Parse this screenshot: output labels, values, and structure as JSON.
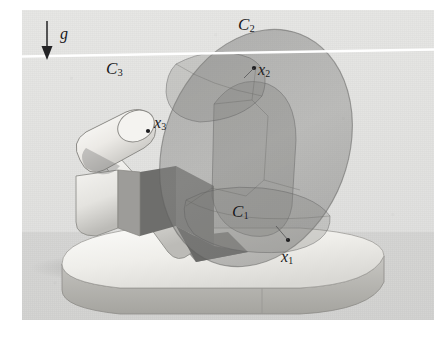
{
  "figure": {
    "kind": "technical-illustration",
    "background_color": "#e4e4e2",
    "plate_margin_color": "#ffffff"
  },
  "gravity": {
    "symbol": "g",
    "direction": "down",
    "arrow_color": "#232325"
  },
  "horizon_line": {
    "color": "#ffffff",
    "description": "white horizontal reference line spanning the plate"
  },
  "bounding_volumes": [
    {
      "id": "C1",
      "base": "C",
      "sub": "1",
      "label_x": 232,
      "label_y": 203,
      "fill": "#9a9a99"
    },
    {
      "id": "C2",
      "base": "C",
      "sub": "2",
      "label_x": 238,
      "label_y": 16,
      "fill": "#9a9a99"
    },
    {
      "id": "C3",
      "base": "C",
      "sub": "3",
      "label_x": 106,
      "label_y": 60,
      "fill": "#9a9a99"
    }
  ],
  "points": [
    {
      "id": "x1",
      "base": "x",
      "sub": "1",
      "label_x": 281,
      "label_y": 249,
      "marker_x": 288,
      "marker_y": 240
    },
    {
      "id": "x2",
      "base": "x",
      "sub": "2",
      "label_x": 258,
      "label_y": 62,
      "marker_x": 254,
      "marker_y": 68
    },
    {
      "id": "x3",
      "base": "x",
      "sub": "3",
      "label_x": 154,
      "label_y": 115,
      "marker_x": 148,
      "marker_y": 131
    }
  ],
  "robot": {
    "base": {
      "name": "rounded-base-slab",
      "top_color": "#f0efec",
      "rim_color": "#b9b8b4"
    },
    "links": [
      {
        "name": "link-lower",
        "color": "#eeedea",
        "shadow_color": "#6f6f6d"
      },
      {
        "name": "link-middle",
        "color": "#e9e8e5",
        "shadow_color": "#7c7c7a"
      },
      {
        "name": "link-upper-capsule",
        "color": "#efeeeb",
        "shadow_color": "#8b8b89"
      }
    ]
  }
}
